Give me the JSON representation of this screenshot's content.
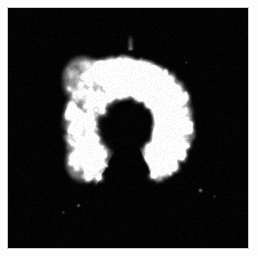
{
  "image": {
    "kind": "fluorescence-micrograph",
    "title": "Fluorescence micrograph",
    "subject": "crescent-shaped cell",
    "modality": "grayscale epifluorescence",
    "width_px": 258,
    "height_px": 256,
    "frame": {
      "border_color": "#c8c8c8",
      "page_background": "#fdfdfd",
      "inset_left_px": 7,
      "inset_top_px": 7,
      "inner_width_px": 242,
      "inner_height_px": 242
    },
    "background_color": "#010101",
    "highlight_color": "#f2f2f2",
    "midtone_color": "#8a8a8a",
    "shadow_color": "#1b1b1b"
  },
  "render": {
    "seed": 20240517,
    "noise_floor": 6,
    "grain_amount": 26,
    "puncta_count": 520,
    "blur_px": 0.9
  },
  "object": {
    "shape": "open C / crescent with hooked upper-left lobe",
    "center_x": 128,
    "center_y": 124,
    "outer_radius": 66,
    "inner_radius": 27,
    "arc_start_deg": 118,
    "arc_end_deg": 425,
    "lobe_upper_left": {
      "cx": 82,
      "cy": 80,
      "rx": 22,
      "ry": 26,
      "intensity": 0.62
    },
    "lobe_lower_left": {
      "cx": 83,
      "cy": 160,
      "rx": 20,
      "ry": 24,
      "intensity": 0.55
    },
    "spike_top": {
      "x": 130,
      "y": 44,
      "h": 10
    }
  },
  "bright_regions": [
    {
      "cx": 126,
      "cy": 74,
      "r": 16,
      "intensity": 0.95
    },
    {
      "cx": 152,
      "cy": 96,
      "r": 14,
      "intensity": 0.92
    },
    {
      "cx": 163,
      "cy": 126,
      "r": 15,
      "intensity": 0.98
    },
    {
      "cx": 156,
      "cy": 158,
      "r": 13,
      "intensity": 0.9
    },
    {
      "cx": 132,
      "cy": 180,
      "r": 13,
      "intensity": 0.84
    },
    {
      "cx": 104,
      "cy": 178,
      "r": 11,
      "intensity": 0.8
    },
    {
      "cx": 88,
      "cy": 150,
      "r": 11,
      "intensity": 0.76
    },
    {
      "cx": 98,
      "cy": 62,
      "r": 12,
      "intensity": 0.7
    },
    {
      "cx": 150,
      "cy": 62,
      "r": 10,
      "intensity": 0.72
    },
    {
      "cx": 172,
      "cy": 100,
      "r": 9,
      "intensity": 0.66
    }
  ],
  "dark_core": {
    "cx": 118,
    "cy": 130,
    "rx": 24,
    "ry": 31,
    "rotation_deg": -12
  },
  "background_specks": [
    {
      "x": 200,
      "y": 190,
      "r": 1.6,
      "intensity": 0.55
    },
    {
      "x": 78,
      "y": 205,
      "r": 1.4,
      "intensity": 0.45
    },
    {
      "x": 63,
      "y": 212,
      "r": 1.1,
      "intensity": 0.3
    },
    {
      "x": 214,
      "y": 196,
      "r": 1.0,
      "intensity": 0.28
    },
    {
      "x": 186,
      "y": 62,
      "r": 1.0,
      "intensity": 0.25
    }
  ],
  "scale_bar": {
    "visible": false,
    "label": ""
  },
  "annotations": {
    "visible": false,
    "items": []
  }
}
